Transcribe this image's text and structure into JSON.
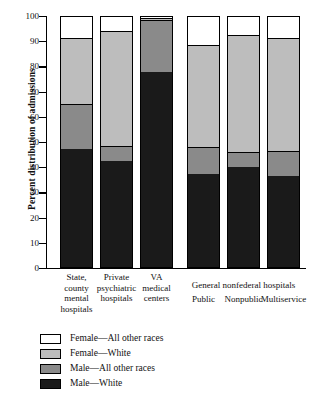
{
  "chart_data": {
    "type": "bar",
    "subtype": "stacked-100-percent",
    "title": "",
    "xlabel": "",
    "ylabel": "Percent distribution of admissions",
    "ylim": [
      0,
      100
    ],
    "yticks": [
      0,
      10,
      20,
      30,
      40,
      50,
      60,
      70,
      80,
      90,
      100
    ],
    "grid": false,
    "legend_position": "below-plot-left",
    "categories": [
      "State, county mental hospitals",
      "Private psychiatric hospitals",
      "VA medical centers",
      "Public",
      "Nonpublic",
      "Multiservice"
    ],
    "category_lines": [
      [
        "State,",
        "county",
        "mental",
        "hospitals"
      ],
      [
        "Private",
        "psychiatric",
        "hospitals"
      ],
      [
        "VA",
        "medical",
        "centers"
      ],
      [
        "Public"
      ],
      [
        "Nonpublic"
      ],
      [
        "Multiservice"
      ]
    ],
    "group_header": "General nonfederal hospitals",
    "group_header_members": [
      "Public",
      "Nonpublic",
      "Multiservice"
    ],
    "series": [
      {
        "name": "Male—White",
        "color": "#1a1a1a",
        "values": [
          47,
          42,
          77.5,
          37,
          39.5,
          36
        ]
      },
      {
        "name": "Male—All other races",
        "color": "#8a8a8a",
        "values": [
          17.5,
          6,
          20.5,
          10.5,
          6,
          10
        ]
      },
      {
        "name": "Female—White",
        "color": "#bdbdbd",
        "values": [
          26.5,
          45.5,
          1,
          40.5,
          46.5,
          45
        ]
      },
      {
        "name": "Female—All other races",
        "color": "#ffffff",
        "values": [
          9,
          6.5,
          1,
          12,
          8,
          9
        ]
      }
    ],
    "cumulative_tops": {
      "male_white": [
        47,
        42,
        77.5,
        37,
        39.5,
        36
      ],
      "male_other": [
        64.5,
        48,
        98,
        47.5,
        45.5,
        46
      ],
      "female_white": [
        91,
        93.5,
        99,
        88,
        92,
        91
      ],
      "female_other": [
        100,
        100,
        100,
        100,
        100,
        100
      ]
    }
  },
  "legend": {
    "items": [
      {
        "label": "Female—All other races",
        "color": "#ffffff"
      },
      {
        "label": "Female—White",
        "color": "#bdbdbd"
      },
      {
        "label": "Male—All other races",
        "color": "#8a8a8a"
      },
      {
        "label": "Male—White",
        "color": "#1a1a1a"
      }
    ]
  },
  "axis": {
    "y_title": "Percent distribution of admissions",
    "tick_labels": [
      "100",
      "90",
      "80",
      "70",
      "60",
      "50",
      "40",
      "30",
      "20",
      "10",
      "0"
    ]
  }
}
